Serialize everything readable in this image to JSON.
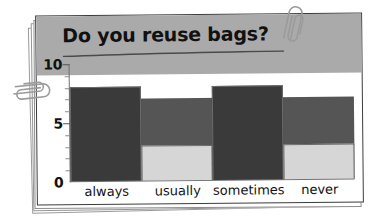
{
  "card": {
    "title": "Do you reuse bags?",
    "corner_fold": "dog-ear-fold",
    "clips": [
      {
        "name": "paper-clip-top",
        "position": "top-right"
      },
      {
        "name": "paper-clip-left",
        "position": "left-edge"
      }
    ]
  },
  "chart_data": {
    "type": "bar",
    "title": "Do you reuse bags?",
    "categories": [
      "always",
      "usually",
      "sometimes",
      "never"
    ],
    "values": [
      5,
      7,
      8,
      3
    ],
    "colors": [
      "#aaaaaa",
      "#555555",
      "#3a3a3a",
      "#d6d6d6"
    ],
    "xlabel": "",
    "ylabel": "",
    "ylim": [
      0,
      10
    ],
    "ytick_labels": [
      "10",
      "5",
      "0"
    ],
    "ytick_values": [
      10,
      5,
      0
    ],
    "minor_tick_step": 1,
    "grid": false,
    "legend": "none",
    "bar_gap": 0
  }
}
